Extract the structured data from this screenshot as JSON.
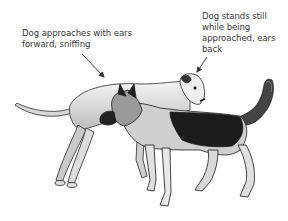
{
  "annotations": [
    {
      "id": "approaching-dog",
      "text": "Dog approaches with ears\nforward, sniffing",
      "arrow": {
        "from": [
          82,
          54
        ],
        "to": [
          104,
          77
        ]
      }
    },
    {
      "id": "approached-dog",
      "text": "Dog stands still\nwhile being\napproached, ears\nback",
      "arrow": {
        "from": [
          207,
          57
        ],
        "to": [
          197,
          72
        ]
      }
    }
  ],
  "figures": [
    {
      "name": "light-coated-dog",
      "description": "Light short-haired dog standing still, ears back, facing right"
    },
    {
      "name": "shepherd-dog",
      "description": "Dark-saddled shepherd-type dog approaching, ears forward, sniffing"
    }
  ],
  "colors": {
    "text": "#3a3a3a",
    "ink": "#1a1a1a",
    "arrow": "#333333"
  }
}
